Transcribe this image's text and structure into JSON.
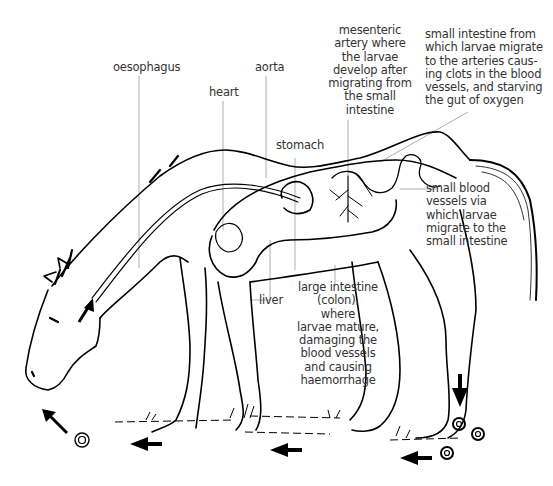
{
  "diagram": {
    "colors": {
      "ink": "#000000",
      "label_text": "#333333",
      "leader_line": "#9a9a9a",
      "background": "#ffffff"
    },
    "labels": {
      "oesophagus": "oesophagus",
      "heart": "heart",
      "aorta": "aorta",
      "stomach": "stomach",
      "liver": "liver",
      "mesenteric_artery": [
        "mesenteric",
        "artery where",
        "the larvae",
        "develop after",
        "migrating from",
        "the small",
        "intestine"
      ],
      "small_intestine": [
        "small intestine from",
        "which larvae migrate",
        "to the arteries caus-",
        "ing clots in the blood",
        "vessels, and starving",
        "the gut of oxygen"
      ],
      "small_blood_vessels": [
        "small blood",
        "vessels via",
        "which larvae",
        "migrate to the",
        "small intestine"
      ],
      "large_intestine": [
        "large intestine",
        "(colon),",
        "where",
        "larvae mature,",
        "damaging the",
        "blood vessels",
        "and causing",
        "haemorrhage"
      ]
    },
    "icons": [
      "arrow-up-left-icon",
      "arrow-left-icon",
      "arrow-down-icon",
      "larva-egg-icon"
    ]
  }
}
